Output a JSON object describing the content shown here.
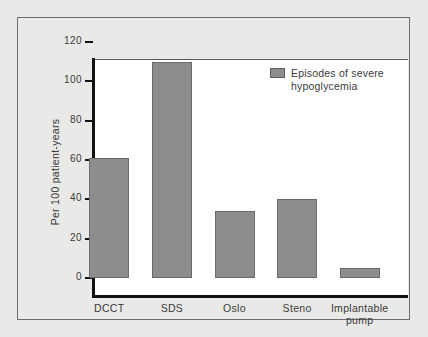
{
  "chart_data": {
    "type": "bar",
    "title": "",
    "subtitle": "",
    "xlabel": "",
    "ylabel": "Per 100 patient-years",
    "ylim": [
      0,
      120
    ],
    "yticks": [
      0,
      20,
      40,
      60,
      80,
      100,
      120
    ],
    "ytick_labels": [
      "0",
      "20",
      "40",
      "60",
      "80",
      "100",
      "120"
    ],
    "grid": false,
    "legend_position": "top-right",
    "categories": [
      "DCCT",
      "SDS",
      "Oslo",
      "Steno",
      "Implantable pump"
    ],
    "category_label_lines": [
      [
        "DCCT"
      ],
      [
        "SDS"
      ],
      [
        "Oslo"
      ],
      [
        "Steno"
      ],
      [
        "Implantable",
        "pump"
      ]
    ],
    "series": [
      {
        "name": "Episodes of severe hypoglycemia",
        "values": [
          61,
          110,
          34,
          40,
          5
        ],
        "color": "#8d8d8d"
      }
    ],
    "legend": [
      {
        "label_lines": [
          "Episodes of severe",
          "hypoglycemia"
        ],
        "label": "Episodes of severe hypoglycemia",
        "color": "#8d8d8d"
      }
    ]
  },
  "colors": {
    "page_background": "#e9e9e7",
    "plot_background": "#ffffff",
    "frame_border": "#6d6d6d",
    "axis_line": "#111111",
    "bar_fill": "#8d8d8d",
    "bar_border": "#6a6a6a",
    "text": "#3a3a3a"
  }
}
